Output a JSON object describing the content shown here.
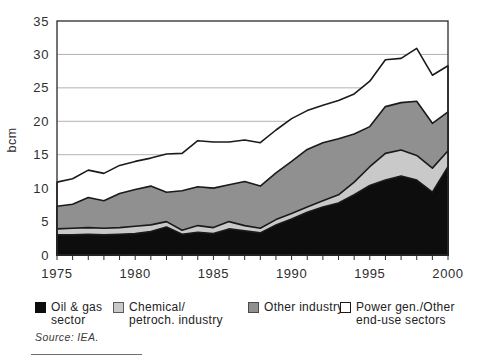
{
  "figure": {
    "y_axis_label": "bcm",
    "source": "Source: IEA.",
    "legend": [
      {
        "line1": "Oil & gas",
        "line2": "sector",
        "color": "#0d0d0d",
        "border": "#0d0d0d"
      },
      {
        "line1": "Chemical/",
        "line2": "petroch. industry",
        "color": "#c9c9c9",
        "border": "#5a5a5a"
      },
      {
        "line1": "Other industry",
        "line2": "",
        "color": "#909090",
        "border": "#4a4a4a"
      },
      {
        "line1": "Power gen./Other",
        "line2": "end-use sectors",
        "color": "#ffffff",
        "border": "#1a1a1a"
      }
    ]
  },
  "chart_data": {
    "type": "area",
    "stacked": true,
    "title": "",
    "xlabel": "",
    "ylabel": "bcm",
    "ylim": [
      0,
      35
    ],
    "ytick_step": 5,
    "grid": "horizontal",
    "gridline_color": "#b3b3b3",
    "outline_color": "#1a1a1a",
    "frame_color": "#2a2a2a",
    "legend_position": "bottom",
    "x": [
      1975,
      1976,
      1977,
      1978,
      1979,
      1980,
      1981,
      1982,
      1983,
      1984,
      1985,
      1986,
      1987,
      1988,
      1989,
      1990,
      1991,
      1992,
      1993,
      1994,
      1995,
      1996,
      1997,
      1998,
      1999,
      2000
    ],
    "x_tick_labels": [
      1975,
      1980,
      1985,
      1990,
      1995,
      2000
    ],
    "series": [
      {
        "name": "Oil & gas sector",
        "color": "#0d0d0d",
        "values": [
          3.0,
          3.0,
          3.1,
          3.0,
          3.1,
          3.2,
          3.5,
          4.2,
          3.1,
          3.4,
          3.2,
          3.9,
          3.6,
          3.3,
          4.5,
          5.4,
          6.4,
          7.2,
          7.8,
          9.0,
          10.4,
          11.2,
          11.8,
          11.2,
          9.4,
          13.2
        ]
      },
      {
        "name": "Chemical/petroch. industry",
        "color": "#c9c9c9",
        "values": [
          0.9,
          1.0,
          1.0,
          1.0,
          1.0,
          1.1,
          1.0,
          0.8,
          0.6,
          1.0,
          0.9,
          1.1,
          0.8,
          0.7,
          0.8,
          0.8,
          0.8,
          0.9,
          1.2,
          1.9,
          2.8,
          4.0,
          3.9,
          3.7,
          3.6,
          2.4
        ]
      },
      {
        "name": "Other industry",
        "color": "#909090",
        "values": [
          3.4,
          3.6,
          4.5,
          4.1,
          5.1,
          5.5,
          5.8,
          4.4,
          5.9,
          5.8,
          5.9,
          5.5,
          6.6,
          6.3,
          7.0,
          7.8,
          8.6,
          8.7,
          8.4,
          7.2,
          6.0,
          7.0,
          7.1,
          8.1,
          6.7,
          5.8
        ]
      },
      {
        "name": "Power gen./Other end-use sectors",
        "color": "#ffffff",
        "values": [
          3.6,
          3.8,
          4.1,
          4.1,
          4.2,
          4.2,
          4.2,
          5.7,
          5.6,
          6.9,
          6.9,
          6.4,
          6.2,
          6.5,
          6.4,
          6.4,
          5.8,
          5.6,
          5.7,
          6.0,
          6.8,
          7.0,
          6.6,
          7.9,
          7.2,
          6.9
        ]
      }
    ]
  }
}
